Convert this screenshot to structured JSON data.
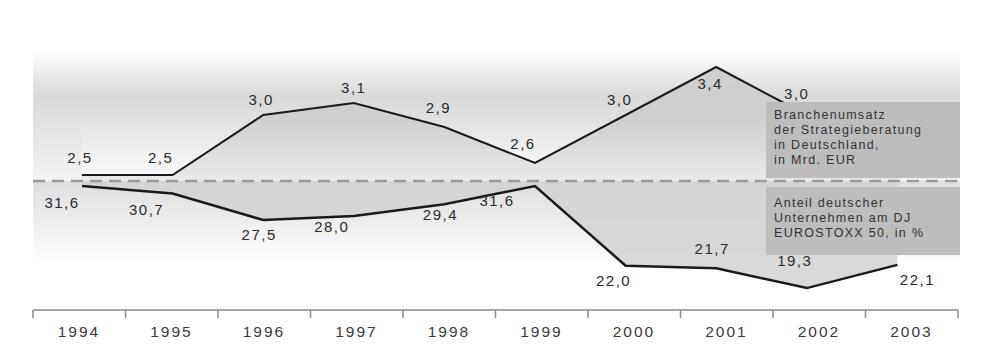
{
  "chart_data": {
    "type": "line",
    "title": "",
    "xlabel": "",
    "ylabel": "",
    "categories": [
      "1994",
      "1995",
      "1996",
      "1997",
      "1998",
      "1999",
      "2000",
      "2001",
      "2002",
      "2003"
    ],
    "series": [
      {
        "name": "Branchenumsatz der Strategieberatung in Deutschland, in Mrd. EUR",
        "values": [
          2.5,
          2.5,
          3.0,
          3.1,
          2.9,
          2.6,
          3.0,
          3.4,
          3.0,
          2.9
        ],
        "labels": [
          "2,5",
          "2,5",
          "3,0",
          "3,1",
          "2,9",
          "2,6",
          "3,0",
          "3,4",
          "3,0",
          "2,9"
        ]
      },
      {
        "name": "Anteil deutscher Unternehmen am DJ EUROSTOXX 50, in %",
        "values": [
          31.6,
          30.7,
          27.5,
          28.0,
          29.4,
          31.6,
          22.0,
          21.7,
          19.3,
          22.1
        ],
        "labels": [
          "31,6",
          "30,7",
          "27,5",
          "28,0",
          "29,4",
          "31,6",
          "22,0",
          "21,7",
          "19,3",
          "22,1"
        ]
      }
    ],
    "grid": false,
    "legend_position": "right, inline boxes",
    "annotations": [
      "dashed separator line between the two series"
    ]
  },
  "legend": {
    "upper": [
      "Branchenumsatz",
      "der Strategieberatung",
      "in Deutschland,",
      "in Mrd. EUR"
    ],
    "lower": [
      "Anteil deutscher",
      "Unternehmen am DJ",
      "EUROSTOXX 50, in %"
    ]
  },
  "colors": {
    "line": "#1a1a1a",
    "fill": "#cfcfcf",
    "legend_bg": "#bdbdbd",
    "dash": "#9a9a9a",
    "axis": "#8a8a8a"
  }
}
